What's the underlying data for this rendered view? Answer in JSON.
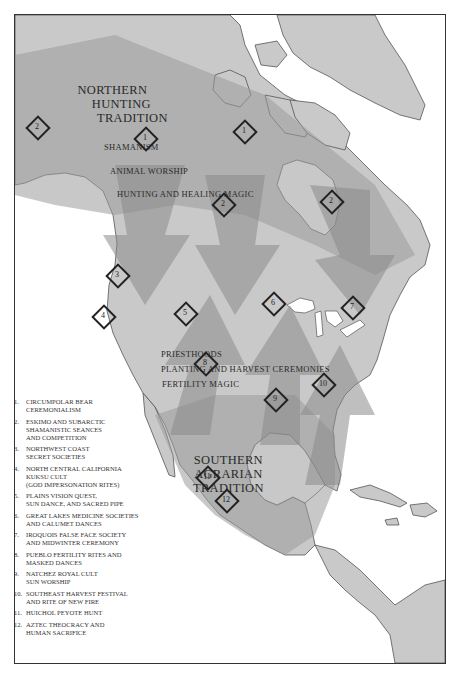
{
  "map": {
    "traditions": {
      "northern": [
        "NORTHERN",
        "HUNTING",
        "TRADITION"
      ],
      "southern": [
        "SOUTHERN",
        "AGRARIAN",
        "TRADITION"
      ]
    },
    "northern_themes": [
      "SHAMANISM",
      "ANIMAL WORSHIP",
      "HUNTING AND HEALING MAGIC"
    ],
    "southern_themes": [
      "PRIESTHOODS",
      "PLANTING AND HARVEST CEREMONIES",
      "FERTILITY MAGIC"
    ],
    "markers": [
      {
        "num": "2",
        "x": 36,
        "y": 126
      },
      {
        "num": "1",
        "x": 144,
        "y": 137
      },
      {
        "num": "1",
        "x": 243,
        "y": 130
      },
      {
        "num": "2",
        "x": 222,
        "y": 203
      },
      {
        "num": "2",
        "x": 330,
        "y": 200
      },
      {
        "num": "3",
        "x": 116,
        "y": 274
      },
      {
        "num": "4",
        "x": 102,
        "y": 315
      },
      {
        "num": "5",
        "x": 184,
        "y": 312
      },
      {
        "num": "6",
        "x": 272,
        "y": 302
      },
      {
        "num": "7",
        "x": 351,
        "y": 306
      },
      {
        "num": "8",
        "x": 204,
        "y": 362
      },
      {
        "num": "9",
        "x": 274,
        "y": 398
      },
      {
        "num": "10",
        "x": 322,
        "y": 383
      },
      {
        "num": "11",
        "x": 206,
        "y": 476
      },
      {
        "num": "12",
        "x": 225,
        "y": 499
      }
    ],
    "colors": {
      "land": "#c9c9c9",
      "band_light": "#b5b5b5",
      "band_dark": "#9a9a9a",
      "outline": "#555555",
      "water": "#ffffff",
      "frame": "#333333"
    }
  },
  "legend": [
    {
      "num": "1.",
      "lines": [
        "CIRCUMPOLAR BEAR",
        "CEREMONIALISM"
      ]
    },
    {
      "num": "2.",
      "lines": [
        "ESKIMO AND SUBARCTIC",
        "SHAMANISTIC SEANCES",
        "AND COMPETITION"
      ]
    },
    {
      "num": "3.",
      "lines": [
        "NORTHWEST COAST",
        "SECRET SOCIETIES"
      ]
    },
    {
      "num": "4.",
      "lines": [
        "NORTH CENTRAL CALIFORNIA",
        "KUKSU CULT",
        "(GOD IMPERSONATION RITES)"
      ]
    },
    {
      "num": "5.",
      "lines": [
        "PLAINS VISION QUEST,",
        "SUN DANCE, AND SACRED PIPE"
      ]
    },
    {
      "num": "6.",
      "lines": [
        "GREAT LAKES MEDICINE SOCIETIES",
        "AND CALUMET DANCES"
      ]
    },
    {
      "num": "7.",
      "lines": [
        "IROQUOIS FALSE FACE SOCIETY",
        "AND MIDWINTER CEREMONY"
      ]
    },
    {
      "num": "8.",
      "lines": [
        "PUEBLO FERTILITY RITES AND",
        "MASKED DANCES"
      ]
    },
    {
      "num": "9.",
      "lines": [
        "NATCHEZ ROYAL CULT",
        "SUN WORSHIP"
      ]
    },
    {
      "num": "10.",
      "lines": [
        "SOUTHEAST HARVEST FESTIVAL",
        "AND RITE OF NEW FIRE"
      ]
    },
    {
      "num": "11.",
      "lines": [
        "HUICHOL PEYOTE HUNT"
      ]
    },
    {
      "num": "12.",
      "lines": [
        "AZTEC THEOCRACY AND",
        "HUMAN SACRIFICE"
      ]
    }
  ]
}
